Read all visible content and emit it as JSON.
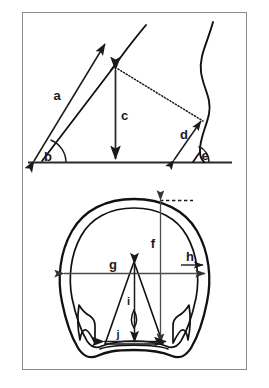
{
  "figure": {
    "title": "",
    "panels": [
      {
        "id": "lateral-view",
        "name": "lateral-hoof-view",
        "description": "Side (lateral) view of horse hoof and pastern with angle and height measurements"
      },
      {
        "id": "solar-view",
        "name": "solar-hoof-view",
        "description": "Bottom (solar) view of horse hoof showing wall, sole, bars and frog with length and width measurements"
      }
    ]
  },
  "labels": {
    "a": "a",
    "b": "b",
    "c": "c",
    "d": "d",
    "e": "e",
    "f": "f",
    "g": "g",
    "h": "h",
    "i": "i",
    "j": "j"
  },
  "colors": {
    "ink": "#1a1a1a",
    "line": "#000000",
    "frame": "#808080",
    "background": "#ffffff",
    "measure": "#4d4d4d"
  },
  "frame": {
    "x": 22,
    "y": 12,
    "width": 225,
    "height": 358,
    "stroke": "#808080"
  }
}
